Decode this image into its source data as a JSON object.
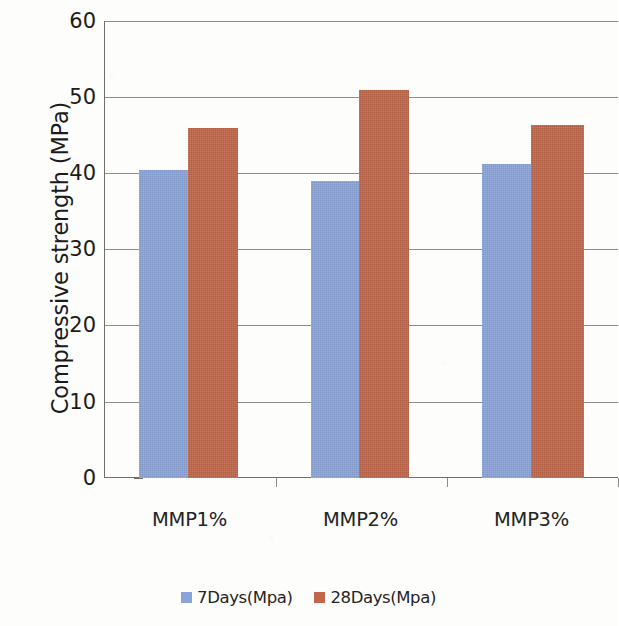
{
  "chart_data": {
    "type": "bar",
    "title": "",
    "xlabel": "",
    "ylabel": "Compressive strength (MPa)",
    "categories": [
      "MMP1%",
      "MMP2%",
      "MMP3%"
    ],
    "series": [
      {
        "name": "7Days(Mpa)",
        "color": "#8ba4d8",
        "values": [
          40.5,
          39.0,
          41.2
        ]
      },
      {
        "name": "28Days(Mpa)",
        "color": "#c0674a",
        "values": [
          46.0,
          51.0,
          46.3
        ]
      }
    ],
    "ylim": [
      0,
      60
    ],
    "ytick_step": 10,
    "yticks": [
      "60",
      "50",
      "40",
      "30",
      "20",
      "10",
      "0"
    ],
    "grid": true,
    "legend_position": "bottom",
    "note_right_edge_cropped": true
  },
  "axis": {
    "y_title": "Compressive strength (MPa)",
    "tick_60": "60",
    "tick_50": "50",
    "tick_40": "40",
    "tick_30": "30",
    "tick_20": "20",
    "tick_10": "10",
    "tick_0": "0"
  },
  "categories": {
    "c0": "MMP1%",
    "c1": "MMP2%",
    "c2": "MMP3%"
  },
  "legend": {
    "entry0": "7Days(Mpa)",
    "entry1": "28Days(Mpa)"
  },
  "colors": {
    "series_7days": "#8ba4d8",
    "series_28days": "#c0674a",
    "gridline": "#8d8d8d",
    "axis": "#6e6e6e",
    "text": "#1b1b1b",
    "background": "#fdfdfc"
  }
}
